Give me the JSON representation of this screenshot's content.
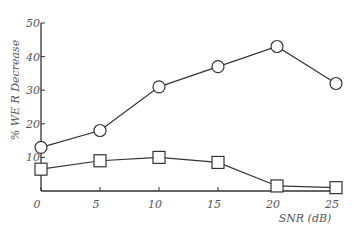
{
  "chart_data": {
    "type": "line",
    "title": "",
    "xlabel": "SNR (dB)",
    "ylabel": "% WE R Decrease",
    "x": [
      0,
      5,
      10,
      15,
      20,
      25
    ],
    "xticks": [
      "0",
      "5",
      "10",
      "15",
      "20",
      "25"
    ],
    "yticks": [
      "10",
      "20",
      "30",
      "40",
      "50"
    ],
    "xlim": [
      0,
      25
    ],
    "ylim": [
      0,
      50
    ],
    "grid": false,
    "legend": null,
    "series": [
      {
        "name": "circle",
        "marker": "circle",
        "values": [
          13,
          18,
          31,
          37,
          43,
          32
        ]
      },
      {
        "name": "square",
        "marker": "square",
        "values": [
          6.5,
          9,
          10,
          8.5,
          1.5,
          1
        ]
      }
    ]
  }
}
